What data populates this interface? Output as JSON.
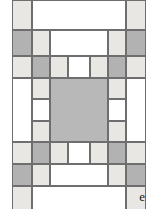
{
  "figure": {
    "label": "e",
    "type": "quilt-block-diagram"
  },
  "colors": {
    "white": "#ffffff",
    "light_gray": "#e8e7e4",
    "dark_gray": "#b2b2b2",
    "center_gray": "#b8b8b8",
    "outline": "#6e6e6e",
    "background": "#ffffff",
    "label_text": "#1a1a1a"
  },
  "legend": {
    "fabrics": [
      {
        "key": "white",
        "name": "white fabric"
      },
      {
        "key": "light",
        "name": "light gray fabric"
      },
      {
        "key": "dark",
        "name": "dark gray fabric"
      }
    ]
  },
  "block": {
    "width": 134,
    "height": 186,
    "description": "Medallion quilt block: solid gray center square framed by pieced light, dark and white rectangular borders with dark corner squares.",
    "patches": [
      {
        "name": "patch-corner-top-left",
        "x": 0,
        "y": 0,
        "w": 20,
        "h": 30,
        "fill": "light"
      },
      {
        "name": "patch-top-border-center",
        "x": 20,
        "y": 0,
        "w": 94,
        "h": 30,
        "fill": "white"
      },
      {
        "name": "patch-corner-top-right",
        "x": 114,
        "y": 0,
        "w": 20,
        "h": 30,
        "fill": "light"
      },
      {
        "name": "patch-row2-left-dark",
        "x": 0,
        "y": 30,
        "w": 20,
        "h": 26,
        "fill": "dark"
      },
      {
        "name": "patch-row2-left-light",
        "x": 20,
        "y": 30,
        "w": 18,
        "h": 26,
        "fill": "light"
      },
      {
        "name": "patch-row2-center-white",
        "x": 38,
        "y": 30,
        "w": 58,
        "h": 26,
        "fill": "white"
      },
      {
        "name": "patch-row2-right-light",
        "x": 96,
        "y": 30,
        "w": 18,
        "h": 26,
        "fill": "light"
      },
      {
        "name": "patch-row2-right-dark",
        "x": 114,
        "y": 30,
        "w": 20,
        "h": 26,
        "fill": "dark"
      },
      {
        "name": "patch-row3-cell-1-light",
        "x": 0,
        "y": 56,
        "w": 20,
        "h": 22,
        "fill": "light"
      },
      {
        "name": "patch-row3-cell-2-dark",
        "x": 20,
        "y": 56,
        "w": 18,
        "h": 22,
        "fill": "dark"
      },
      {
        "name": "patch-row3-cell-3-light",
        "x": 38,
        "y": 56,
        "w": 18,
        "h": 22,
        "fill": "light"
      },
      {
        "name": "patch-row3-cell-4-white",
        "x": 56,
        "y": 56,
        "w": 22,
        "h": 22,
        "fill": "white"
      },
      {
        "name": "patch-row3-cell-5-light",
        "x": 78,
        "y": 56,
        "w": 18,
        "h": 22,
        "fill": "light"
      },
      {
        "name": "patch-row3-cell-6-dark",
        "x": 96,
        "y": 56,
        "w": 18,
        "h": 22,
        "fill": "dark"
      },
      {
        "name": "patch-row3-cell-7-light",
        "x": 114,
        "y": 56,
        "w": 20,
        "h": 22,
        "fill": "light"
      },
      {
        "name": "patch-left-side-white",
        "x": 0,
        "y": 78,
        "w": 20,
        "h": 64,
        "fill": "white"
      },
      {
        "name": "patch-left-inner-light-top",
        "x": 20,
        "y": 78,
        "w": 18,
        "h": 21,
        "fill": "light"
      },
      {
        "name": "patch-left-inner-white-mid",
        "x": 20,
        "y": 99,
        "w": 18,
        "h": 22,
        "fill": "white"
      },
      {
        "name": "patch-left-inner-light-bot",
        "x": 20,
        "y": 121,
        "w": 18,
        "h": 21,
        "fill": "light"
      },
      {
        "name": "patch-center-square",
        "x": 38,
        "y": 78,
        "w": 58,
        "h": 64,
        "fill": "mid"
      },
      {
        "name": "patch-right-inner-light-top",
        "x": 96,
        "y": 78,
        "w": 18,
        "h": 21,
        "fill": "light"
      },
      {
        "name": "patch-right-inner-white-mid",
        "x": 96,
        "y": 99,
        "w": 18,
        "h": 22,
        "fill": "white"
      },
      {
        "name": "patch-right-inner-light-bot",
        "x": 96,
        "y": 121,
        "w": 18,
        "h": 21,
        "fill": "light"
      },
      {
        "name": "patch-right-side-white",
        "x": 114,
        "y": 78,
        "w": 20,
        "h": 64,
        "fill": "white"
      },
      {
        "name": "patch-row5-cell-1-light",
        "x": 0,
        "y": 142,
        "w": 20,
        "h": 22,
        "fill": "light"
      },
      {
        "name": "patch-row5-cell-2-dark",
        "x": 20,
        "y": 142,
        "w": 18,
        "h": 22,
        "fill": "dark"
      },
      {
        "name": "patch-row5-cell-3-light",
        "x": 38,
        "y": 142,
        "w": 18,
        "h": 22,
        "fill": "light"
      },
      {
        "name": "patch-row5-cell-4-white",
        "x": 56,
        "y": 142,
        "w": 22,
        "h": 22,
        "fill": "white"
      },
      {
        "name": "patch-row5-cell-5-light",
        "x": 78,
        "y": 142,
        "w": 18,
        "h": 22,
        "fill": "light"
      },
      {
        "name": "patch-row5-cell-6-dark",
        "x": 96,
        "y": 142,
        "w": 18,
        "h": 22,
        "fill": "dark"
      },
      {
        "name": "patch-row5-cell-7-light",
        "x": 114,
        "y": 142,
        "w": 20,
        "h": 22,
        "fill": "light"
      },
      {
        "name": "patch-row6-left-dark",
        "x": 0,
        "y": 164,
        "w": 20,
        "h": 22,
        "fill": "dark"
      },
      {
        "name": "patch-row6-left-light",
        "x": 20,
        "y": 164,
        "w": 18,
        "h": 22,
        "fill": "light"
      },
      {
        "name": "patch-row6-center-white",
        "x": 38,
        "y": 164,
        "w": 58,
        "h": 22,
        "fill": "white"
      },
      {
        "name": "patch-row6-right-light",
        "x": 96,
        "y": 164,
        "w": 18,
        "h": 22,
        "fill": "light"
      },
      {
        "name": "patch-row6-right-dark",
        "x": 114,
        "y": 164,
        "w": 20,
        "h": 22,
        "fill": "dark"
      },
      {
        "name": "patch-corner-bottom-left",
        "x": 0,
        "y": 186,
        "w": 20,
        "h": 24,
        "fill": "light"
      },
      {
        "name": "patch-bottom-border-center",
        "x": 20,
        "y": 186,
        "w": 94,
        "h": 24,
        "fill": "white"
      },
      {
        "name": "patch-corner-bottom-right",
        "x": 114,
        "y": 186,
        "w": 20,
        "h": 24,
        "fill": "light"
      }
    ]
  }
}
